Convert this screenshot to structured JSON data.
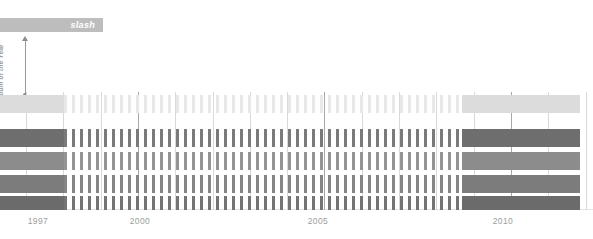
{
  "header": {
    "title": "slash",
    "bar_color": "#bdbdbd",
    "title_color": "#ffffff"
  },
  "yaxis": {
    "label": "Album of the Year",
    "arrow_icon": "up-arrow-icon",
    "dot_icon": "dot-icon",
    "color": "#9a9a9a"
  },
  "chart_data": {
    "type": "bar",
    "title": "slash",
    "subtitle": "",
    "xlabel": "",
    "ylabel": "Album of the Year",
    "grid": true,
    "legend": "none",
    "xlim": [
      1996.3,
      2012.2
    ],
    "x_tick_labels": [
      "1997",
      "2000",
      "2005",
      "2010"
    ],
    "x_tick_values": [
      1997,
      2000,
      2005,
      2010
    ],
    "x_tick_px": [
      38,
      140,
      318,
      503
    ],
    "gridline_years": [
      1997,
      1998,
      1999,
      2000,
      2001,
      2002,
      2003,
      2004,
      2005,
      2006,
      2007,
      2008,
      2009,
      2010,
      2011,
      2012
    ],
    "major_gridline_years": [
      2000,
      2005,
      2010
    ],
    "series": [
      {
        "name": "row-1",
        "color": "#dcdcdc",
        "dash_color": "#e8e8e8",
        "y_px": 95,
        "height_px": 18,
        "solid_left_end_px": 64,
        "solid_right_start_px": 462,
        "solid_right_end_px": 580,
        "dash_start_px": 64,
        "dash_end_px": 462
      },
      {
        "name": "row-2",
        "color": "#6e6e6e",
        "dash_color": "#7a7a7a",
        "y_px": 129,
        "height_px": 18,
        "solid_left_end_px": 64,
        "solid_right_start_px": 462,
        "solid_right_end_px": 580,
        "dash_start_px": 64,
        "dash_end_px": 462
      },
      {
        "name": "row-3",
        "color": "#8c8c8c",
        "dash_color": "#949494",
        "y_px": 152,
        "height_px": 18,
        "solid_left_end_px": 64,
        "solid_right_start_px": 462,
        "solid_right_end_px": 580,
        "dash_start_px": 64,
        "dash_end_px": 462
      },
      {
        "name": "row-4",
        "color": "#7c7c7c",
        "dash_color": "#858585",
        "y_px": 175,
        "height_px": 18,
        "solid_left_end_px": 64,
        "solid_right_start_px": 462,
        "solid_right_end_px": 580,
        "dash_start_px": 64,
        "dash_end_px": 462
      },
      {
        "name": "row-5",
        "color": "#6b6b6b",
        "dash_color": "#747474",
        "y_px": 196,
        "height_px": 14,
        "solid_left_end_px": 64,
        "solid_right_start_px": 462,
        "solid_right_end_px": 580,
        "dash_start_px": 64,
        "dash_end_px": 462
      }
    ],
    "dash_period_px": 8,
    "dash_width_px": 3,
    "gridline_color": "#d9d9d9",
    "major_gridline_color": "#a8a8a8",
    "baseline_color": "#e3e3e3",
    "tick_label_color": "#9d9d9d",
    "background": "#ffffff"
  }
}
